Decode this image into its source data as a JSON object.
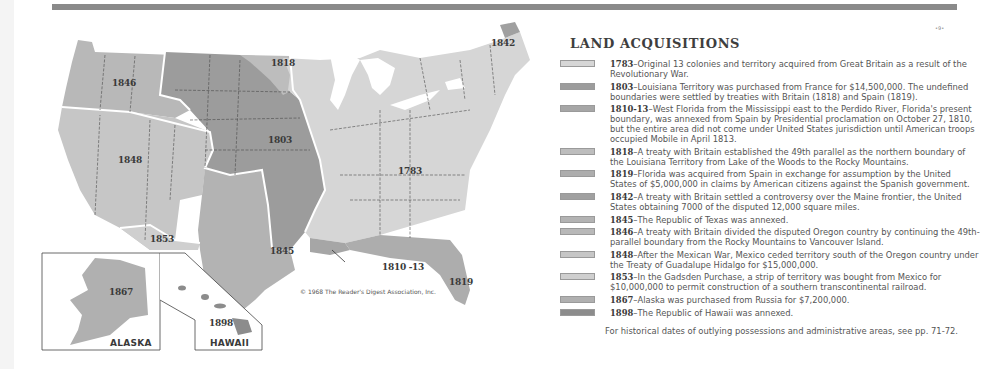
{
  "page": {
    "page_mark": "•9•"
  },
  "map": {
    "copyright": "© 1968 The Reader's Digest Association, Inc.",
    "colors": {
      "1783": "#d6d6d6",
      "1803": "#9c9c9c",
      "1810_13": "#a6a6a6",
      "1818": "#bdbdbd",
      "1819": "#adadad",
      "1842": "#a0a0a0",
      "1845": "#b3b3b3",
      "1846": "#b8b8b8",
      "1848": "#c6c6c6",
      "1853": "#cfcfcf",
      "1867": "#b0b0b0",
      "1898": "#8c8c8c",
      "boundary": "#ffffff",
      "state_line": "#4a4a4a"
    },
    "region_labels": {
      "r1846": "1846",
      "r1818": "1818",
      "r1803": "1803",
      "r1848": "1848",
      "r1783": "1783",
      "r1842": "1842",
      "r1853": "1853",
      "r1845": "1845",
      "r1810_13": "1810 -13",
      "r1819": "1819",
      "r1867": "1867",
      "r1898": "1898"
    },
    "insets": {
      "alaska": "ALASKA",
      "hawaii": "HAWAII"
    }
  },
  "legend": {
    "title": "LAND ACQUISITIONS",
    "items": [
      {
        "year": "1783",
        "text": "Original 13 colonies and territory acquired from Great Britain as a result of the Revolutionary War.",
        "color": "#d6d6d6"
      },
      {
        "year": "1803",
        "text": "Louisiana Territory was purchased from France for $14,500,000. The undefined boundaries were settled by treaties with Britain (1818) and Spain (1819).",
        "color": "#9c9c9c"
      },
      {
        "year": "1810-13",
        "text": "West Florida from the Mississippi east to the Perdido River, Florida's present boundary, was annexed from Spain by Presidential proclamation on October 27, 1810, but the entire area did not come under United States jurisdiction until American troops occupied Mobile in April 1813.",
        "color": "#a6a6a6"
      },
      {
        "year": "1818",
        "text": "A treaty with Britain established the 49th parallel as the northern boundary of the Louisiana Territory from Lake of the Woods to the Rocky Mountains.",
        "color": "#bdbdbd"
      },
      {
        "year": "1819",
        "text": "Florida was acquired from Spain in exchange for assumption by the United States of $5,000,000 in claims by American citizens against the Spanish government.",
        "color": "#adadad"
      },
      {
        "year": "1842",
        "text": "A treaty with Britain settled a controversy over the Maine frontier, the United States obtaining 7000 of the disputed 12,000 square miles.",
        "color": "#a0a0a0"
      },
      {
        "year": "1845",
        "text": "The Republic of Texas was annexed.",
        "color": "#b3b3b3"
      },
      {
        "year": "1846",
        "text": "A treaty with Britain divided the disputed Oregon country by continuing the 49th-parallel boundary from the Rocky Mountains to Vancouver Island.",
        "color": "#b8b8b8"
      },
      {
        "year": "1848",
        "text": "After the Mexican War, Mexico ceded territory south of the Oregon country under the Treaty of Guadalupe Hidalgo for $15,000,000.",
        "color": "#c6c6c6"
      },
      {
        "year": "1853",
        "text": "In the Gadsden Purchase, a strip of territory was bought from Mexico for $10,000,000 to permit construction of a southern transcontinental railroad.",
        "color": "#cfcfcf"
      },
      {
        "year": "1867",
        "text": "Alaska was purchased from Russia for $7,200,000.",
        "color": "#b0b0b0"
      },
      {
        "year": "1898",
        "text": "The Republic of Hawaii was annexed.",
        "color": "#8c8c8c"
      }
    ],
    "dash": "–",
    "footnote": "For historical dates of outlying possessions and administrative areas, see pp. 71-72."
  }
}
